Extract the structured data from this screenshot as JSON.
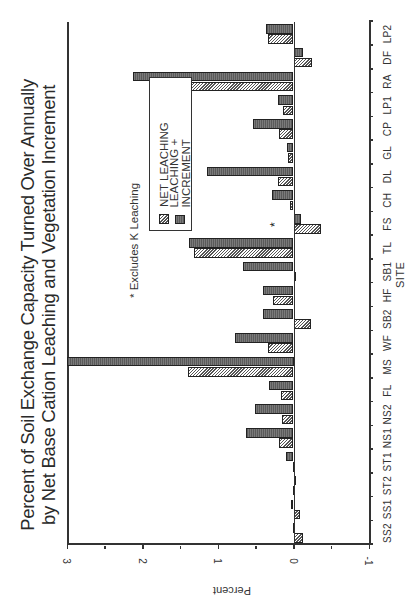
{
  "chart_data": {
    "type": "bar",
    "orientation": "rotated 90deg counter-clockwise (vertical bar chart printed sideways)",
    "title": "Percent of Soil Exchange Capacity Turned Over Annually by Net Base Cation Leaching and Vegetation Increment",
    "title_lines": [
      "Percent of Soil Exchange Capacity Turned Over Annually",
      "by Net Base Cation Leaching and Vegetation Increment"
    ],
    "xlabel": "SITE",
    "ylabel": "Percent",
    "ylim": [
      -1,
      3
    ],
    "yticks": [
      -1,
      0,
      1,
      2,
      3
    ],
    "ytick_labels": [
      "-1",
      "0",
      "1",
      "2",
      "3"
    ],
    "grid": false,
    "legend_position": "upper-left inside plot",
    "categories": [
      "SS2",
      "SS1",
      "ST2",
      "ST1",
      "NS1",
      "NS2",
      "FL",
      "MS",
      "WF",
      "SB2",
      "HF",
      "SB1",
      "TL",
      "FS",
      "CH",
      "DL",
      "GL",
      "CP",
      "LP1",
      "RA",
      "DF",
      "LP2"
    ],
    "series": [
      {
        "name": "NET LEACHING",
        "pattern": "hatched",
        "values": [
          -0.12,
          -0.09,
          0.01,
          0.01,
          0.19,
          0.15,
          0.17,
          1.4,
          0.34,
          -0.23,
          0.27,
          -0.02,
          1.32,
          -0.36,
          0.04,
          0.21,
          0.07,
          0.19,
          0.14,
          1.88,
          -0.24,
          0.34
        ]
      },
      {
        "name": "LEACHING + INCREMENT",
        "pattern": "dark stipple",
        "values": [
          0.01,
          0.03,
          -0.02,
          0.1,
          0.63,
          0.51,
          0.33,
          3.0,
          0.77,
          0.4,
          0.4,
          0.67,
          1.39,
          -0.1,
          0.29,
          1.15,
          0.08,
          0.53,
          0.2,
          2.12,
          -0.13,
          0.37
        ]
      }
    ],
    "annotations": [
      {
        "text": "*",
        "attached_to": "FS",
        "meaning": "Excludes K Leaching"
      }
    ],
    "footnote": "* Excludes K Leaching"
  },
  "legend": {
    "items": [
      {
        "label": "NET LEACHING",
        "pattern": "hatched"
      },
      {
        "label": "LEACHING + INCREMENT",
        "pattern": "dark"
      }
    ]
  },
  "colors": {
    "dark_bar": "#666666",
    "hatch_line": "#555555",
    "axis": "#333333",
    "background": "#ffffff"
  }
}
